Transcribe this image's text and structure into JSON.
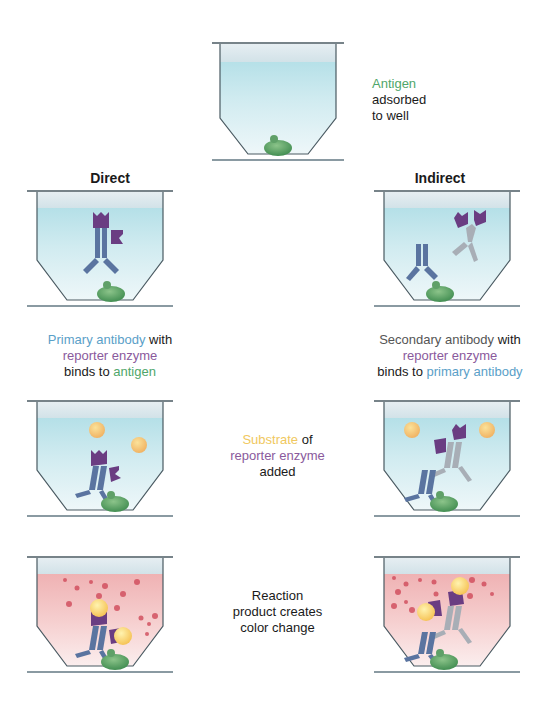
{
  "diagram": {
    "colors": {
      "antigen": "#4fa66a",
      "primary_antibody": "#5a74a0",
      "secondary_antibody": "#a8aeb6",
      "reporter_enzyme": "#6a3d82",
      "substrate": "#f4b860",
      "product": "#d04a5a",
      "well_liquid_blue": "#c8e6ec",
      "well_liquid_red": "#f2c0c0"
    },
    "step1": {
      "parts": [
        "Antigen",
        "adsorbed",
        "to well"
      ]
    },
    "columns": {
      "direct": "Direct",
      "indirect": "Indirect"
    },
    "step2": {
      "direct": {
        "line1_a": "Primary antibody",
        "line1_b": " with",
        "line2": "reporter enzyme",
        "line3_a": "binds to ",
        "line3_b": "antigen"
      },
      "indirect": {
        "line1_a": "Secondary antibody",
        "line1_b": " with",
        "line2": "reporter enzyme",
        "line3_a": "binds to ",
        "line3_b": "primary antibody"
      }
    },
    "step3": {
      "line1_a": "Substrate",
      "line1_b": " of",
      "line2": "reporter enzyme",
      "line3": "added"
    },
    "step4": {
      "line1": "Reaction",
      "line2": "product creates",
      "line3": "color change"
    }
  }
}
